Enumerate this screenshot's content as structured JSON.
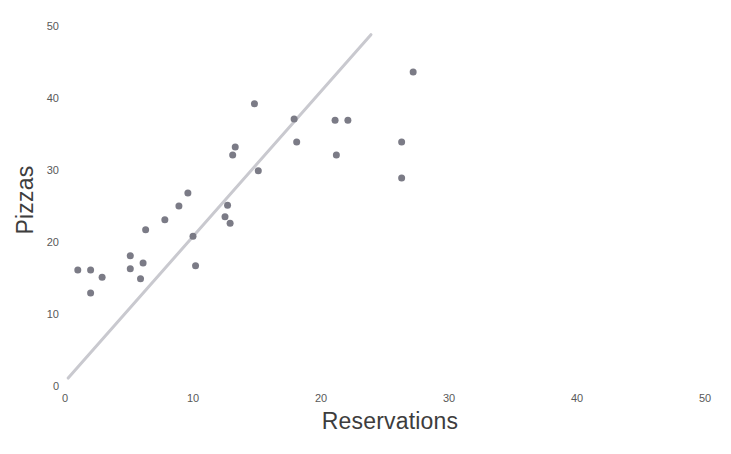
{
  "chart_data": {
    "type": "scatter",
    "title": "",
    "xlabel": "Reservations",
    "ylabel": "Pizzas",
    "xlim": [
      0,
      52.7
    ],
    "ylim": [
      0,
      53.6
    ],
    "xticks": [
      0,
      10,
      20,
      30,
      40,
      50
    ],
    "xtick_labels": [
      "0",
      "10",
      "20",
      "30",
      "40",
      "50"
    ],
    "yticks": [
      0,
      10,
      20,
      30,
      40,
      50
    ],
    "ytick_labels": [
      "0",
      "10",
      "20",
      "30",
      "40",
      "50"
    ],
    "grid": false,
    "legend": null,
    "axes_visible": false,
    "marker": {
      "shape": "circle",
      "color": "#7b7b86",
      "size_px": 5
    },
    "series": [
      {
        "name": "Pizzas vs Reservations",
        "type": "scatter",
        "points": [
          {
            "x": 1.0,
            "y": 16.1
          },
          {
            "x": 2.0,
            "y": 16.1
          },
          {
            "x": 2.0,
            "y": 12.9
          },
          {
            "x": 2.9,
            "y": 15.1
          },
          {
            "x": 5.1,
            "y": 16.3
          },
          {
            "x": 5.1,
            "y": 18.1
          },
          {
            "x": 5.9,
            "y": 14.9
          },
          {
            "x": 6.1,
            "y": 17.1
          },
          {
            "x": 6.3,
            "y": 21.7
          },
          {
            "x": 7.8,
            "y": 23.1
          },
          {
            "x": 8.9,
            "y": 25.0
          },
          {
            "x": 9.6,
            "y": 26.8
          },
          {
            "x": 10.0,
            "y": 20.8
          },
          {
            "x": 10.2,
            "y": 16.7
          },
          {
            "x": 12.5,
            "y": 23.5
          },
          {
            "x": 12.7,
            "y": 25.1
          },
          {
            "x": 12.9,
            "y": 22.6
          },
          {
            "x": 13.1,
            "y": 32.1
          },
          {
            "x": 13.3,
            "y": 33.2
          },
          {
            "x": 14.8,
            "y": 39.2
          },
          {
            "x": 15.1,
            "y": 29.9
          },
          {
            "x": 17.9,
            "y": 37.1
          },
          {
            "x": 18.1,
            "y": 33.9
          },
          {
            "x": 21.1,
            "y": 36.9
          },
          {
            "x": 21.2,
            "y": 32.1
          },
          {
            "x": 22.1,
            "y": 36.9
          },
          {
            "x": 26.3,
            "y": 33.9
          },
          {
            "x": 26.3,
            "y": 28.9
          },
          {
            "x": 27.2,
            "y": 43.6
          }
        ]
      },
      {
        "name": "trend line",
        "type": "line",
        "color": "#c9c9cf",
        "width_px": 3,
        "endpoints": [
          {
            "x": 0.25,
            "y": 1.1
          },
          {
            "x": 23.9,
            "y": 48.8
          }
        ]
      }
    ]
  },
  "axis": {
    "x_label_text": "Reservations",
    "y_label_text": "Pizzas"
  },
  "colors": {
    "background": "#ffffff",
    "marker": "#7b7b86",
    "trendline": "#c9c9cf",
    "tick_text": "#595959",
    "axis_label_text": "#3d3d3d"
  }
}
